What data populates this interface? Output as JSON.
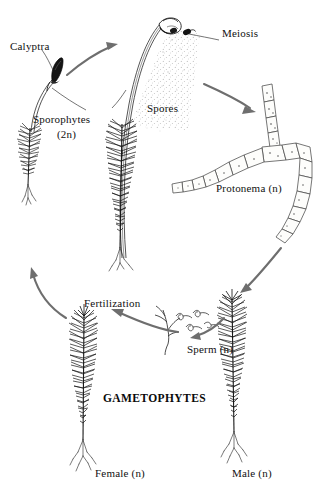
{
  "diagram": {
    "background_color": "#ffffff",
    "ink_color": "#1a1a1a",
    "arrow_color": "#6e6e6e",
    "labels": {
      "calyptra": "Calyptra",
      "sporophytes": "Sporophytes",
      "sporophytes_ploidy": "(2n)",
      "meiosis": "Meiosis",
      "spores": "Spores",
      "protonema": "Protonema (n)",
      "fertilization": "Fertilization",
      "sperm": "Sperm (n)",
      "gametophytes": "GAMETOPHYTES",
      "female": "Female (n)",
      "male": "Male (n)"
    },
    "stages": [
      {
        "name": "sporophyte-with-calyptra",
        "ploidy": "2n",
        "label": "Calyptra"
      },
      {
        "name": "sporophyte-capsule",
        "ploidy": "2n",
        "label": "Sporophytes (2n)"
      },
      {
        "name": "meiosis-event",
        "ploidy": "2n to n",
        "label": "Meiosis"
      },
      {
        "name": "spore-cloud",
        "ploidy": "n",
        "label": "Spores"
      },
      {
        "name": "protonema-filament",
        "ploidy": "n",
        "label": "Protonema (n)"
      },
      {
        "name": "male-gametophyte",
        "ploidy": "n",
        "label": "Male (n)"
      },
      {
        "name": "female-gametophyte",
        "ploidy": "n",
        "label": "Female (n)"
      },
      {
        "name": "sperm-cells",
        "ploidy": "n",
        "label": "Sperm (n)"
      },
      {
        "name": "fertilization-event",
        "ploidy": "n to 2n",
        "label": "Fertilization"
      }
    ]
  }
}
